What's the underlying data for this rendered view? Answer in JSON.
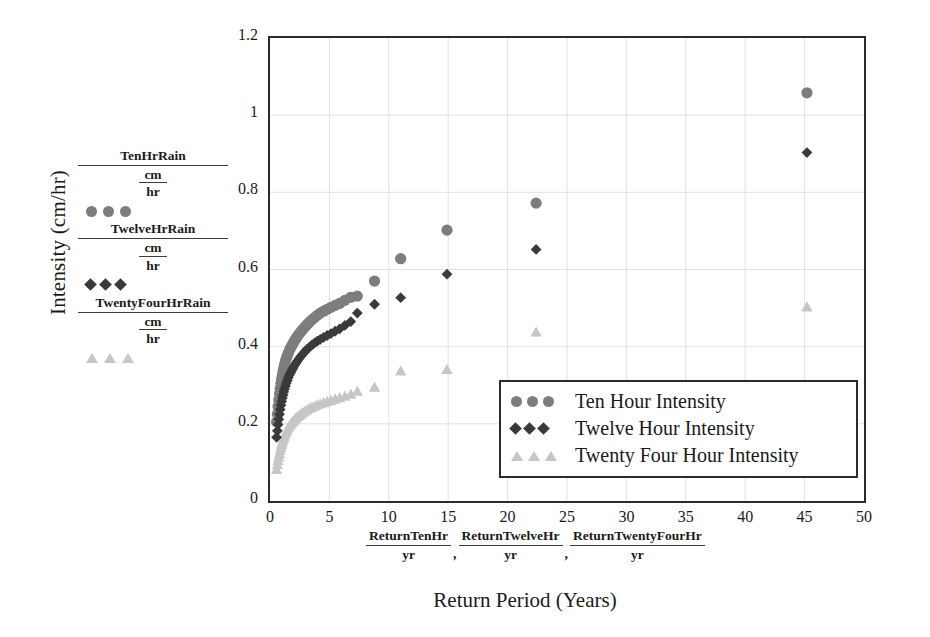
{
  "axes": {
    "y_title": "Intensity (cm/hr)",
    "x_title": "Return Period (Years)",
    "y_ticks": [
      "1.2",
      "1",
      "0.8",
      "0.6",
      "0.4",
      "0.2",
      "0"
    ],
    "x_ticks": [
      "0",
      "5",
      "10",
      "15",
      "20",
      "25",
      "30",
      "35",
      "40",
      "45",
      "50"
    ]
  },
  "left_labels": [
    {
      "numerator": "TenHrRain",
      "den_num": "cm",
      "den_den": "hr",
      "marker": "circle-marker"
    },
    {
      "numerator": "TwelveHrRain",
      "den_num": "cm",
      "den_den": "hr",
      "marker": "diamond-marker"
    },
    {
      "numerator": "TwentyFourHrRain",
      "den_num": "cm",
      "den_den": "hr",
      "marker": "triangle-marker"
    }
  ],
  "bottom_labels": [
    {
      "numerator": "ReturnTenHr",
      "denominator": "yr",
      "separator": ","
    },
    {
      "numerator": "ReturnTwelveHr",
      "denominator": "yr",
      "separator": ","
    },
    {
      "numerator": "ReturnTwentyFourHr",
      "denominator": "yr",
      "separator": ""
    }
  ],
  "legend": {
    "entries": [
      {
        "label": "Ten Hour Intensity",
        "marker": "circle-marker"
      },
      {
        "label": "Twelve Hour Intensity",
        "marker": "diamond-marker"
      },
      {
        "label": "Twenty Four Hour Intensity",
        "marker": "triangle-marker"
      }
    ]
  },
  "colors": {
    "ten_hour": "#7d7d7d",
    "twelve_hour": "#3a3a3a",
    "twenty_four_hour": "#c6c6c6",
    "frame": "#2b2b2b",
    "grid": "#e2e2e2"
  },
  "chart_data": {
    "type": "scatter",
    "title": "",
    "xlabel": "Return Period (Years)",
    "ylabel": "Intensity (cm/hr)",
    "xlim": [
      0,
      50
    ],
    "ylim": [
      0,
      1.2
    ],
    "xticks": [
      0,
      5,
      10,
      15,
      20,
      25,
      30,
      35,
      40,
      45,
      50
    ],
    "yticks": [
      0,
      0.2,
      0.4,
      0.6,
      0.8,
      1.0,
      1.2
    ],
    "grid": "faint vertical and horizontal gridlines",
    "legend_position": "lower right, inside axes",
    "series": [
      {
        "name": "Ten Hour Intensity",
        "marker": "circle",
        "color": "#7d7d7d",
        "points": [
          [
            0.55,
            0.205
          ],
          [
            0.62,
            0.225
          ],
          [
            0.68,
            0.245
          ],
          [
            0.74,
            0.262
          ],
          [
            0.8,
            0.278
          ],
          [
            0.86,
            0.292
          ],
          [
            0.92,
            0.305
          ],
          [
            0.98,
            0.316
          ],
          [
            1.04,
            0.326
          ],
          [
            1.1,
            0.336
          ],
          [
            1.16,
            0.345
          ],
          [
            1.22,
            0.353
          ],
          [
            1.3,
            0.362
          ],
          [
            1.38,
            0.37
          ],
          [
            1.46,
            0.377
          ],
          [
            1.55,
            0.384
          ],
          [
            1.64,
            0.391
          ],
          [
            1.74,
            0.397
          ],
          [
            1.84,
            0.403
          ],
          [
            1.95,
            0.409
          ],
          [
            2.06,
            0.415
          ],
          [
            2.18,
            0.421
          ],
          [
            2.31,
            0.427
          ],
          [
            2.45,
            0.433
          ],
          [
            2.6,
            0.439
          ],
          [
            2.76,
            0.445
          ],
          [
            2.93,
            0.451
          ],
          [
            3.11,
            0.457
          ],
          [
            3.3,
            0.463
          ],
          [
            3.51,
            0.469
          ],
          [
            3.73,
            0.475
          ],
          [
            3.97,
            0.481
          ],
          [
            4.23,
            0.487
          ],
          [
            4.51,
            0.492
          ],
          [
            4.81,
            0.497
          ],
          [
            5.13,
            0.502
          ],
          [
            5.48,
            0.507
          ],
          [
            5.86,
            0.512
          ],
          [
            6.3,
            0.52
          ],
          [
            6.8,
            0.528
          ],
          [
            7.35,
            0.531
          ],
          [
            8.8,
            0.57
          ],
          [
            11.0,
            0.628
          ],
          [
            14.9,
            0.702
          ],
          [
            22.4,
            0.772
          ],
          [
            45.2,
            1.058
          ]
        ]
      },
      {
        "name": "Twelve Hour Intensity",
        "marker": "diamond",
        "color": "#3a3a3a",
        "points": [
          [
            0.55,
            0.165
          ],
          [
            0.62,
            0.182
          ],
          [
            0.68,
            0.198
          ],
          [
            0.74,
            0.212
          ],
          [
            0.8,
            0.225
          ],
          [
            0.86,
            0.237
          ],
          [
            0.92,
            0.248
          ],
          [
            0.98,
            0.258
          ],
          [
            1.04,
            0.267
          ],
          [
            1.1,
            0.275
          ],
          [
            1.16,
            0.283
          ],
          [
            1.22,
            0.29
          ],
          [
            1.3,
            0.298
          ],
          [
            1.38,
            0.306
          ],
          [
            1.46,
            0.313
          ],
          [
            1.55,
            0.32
          ],
          [
            1.64,
            0.327
          ],
          [
            1.74,
            0.333
          ],
          [
            1.84,
            0.339
          ],
          [
            1.95,
            0.345
          ],
          [
            2.06,
            0.351
          ],
          [
            2.18,
            0.357
          ],
          [
            2.31,
            0.363
          ],
          [
            2.45,
            0.369
          ],
          [
            2.6,
            0.375
          ],
          [
            2.76,
            0.381
          ],
          [
            2.93,
            0.387
          ],
          [
            3.11,
            0.393
          ],
          [
            3.3,
            0.398
          ],
          [
            3.51,
            0.404
          ],
          [
            3.73,
            0.409
          ],
          [
            3.97,
            0.414
          ],
          [
            4.23,
            0.419
          ],
          [
            4.51,
            0.424
          ],
          [
            4.81,
            0.429
          ],
          [
            5.13,
            0.434
          ],
          [
            5.48,
            0.44
          ],
          [
            5.86,
            0.446
          ],
          [
            6.3,
            0.455
          ],
          [
            6.8,
            0.465
          ],
          [
            7.35,
            0.487
          ],
          [
            8.8,
            0.51
          ],
          [
            11.0,
            0.527
          ],
          [
            14.9,
            0.588
          ],
          [
            22.4,
            0.652
          ],
          [
            45.2,
            0.903
          ]
        ]
      },
      {
        "name": "Twenty Four Hour Intensity",
        "marker": "triangle",
        "color": "#c6c6c6",
        "points": [
          [
            0.55,
            0.082
          ],
          [
            0.62,
            0.094
          ],
          [
            0.68,
            0.105
          ],
          [
            0.74,
            0.114
          ],
          [
            0.8,
            0.123
          ],
          [
            0.86,
            0.131
          ],
          [
            0.92,
            0.139
          ],
          [
            0.98,
            0.146
          ],
          [
            1.04,
            0.152
          ],
          [
            1.1,
            0.158
          ],
          [
            1.16,
            0.164
          ],
          [
            1.22,
            0.169
          ],
          [
            1.3,
            0.175
          ],
          [
            1.38,
            0.18
          ],
          [
            1.46,
            0.185
          ],
          [
            1.55,
            0.19
          ],
          [
            1.64,
            0.195
          ],
          [
            1.74,
            0.199
          ],
          [
            1.84,
            0.203
          ],
          [
            1.95,
            0.207
          ],
          [
            2.06,
            0.211
          ],
          [
            2.18,
            0.215
          ],
          [
            2.31,
            0.219
          ],
          [
            2.45,
            0.222
          ],
          [
            2.6,
            0.226
          ],
          [
            2.76,
            0.229
          ],
          [
            2.93,
            0.233
          ],
          [
            3.11,
            0.236
          ],
          [
            3.3,
            0.24
          ],
          [
            3.51,
            0.243
          ],
          [
            3.73,
            0.246
          ],
          [
            3.97,
            0.249
          ],
          [
            4.23,
            0.252
          ],
          [
            4.51,
            0.255
          ],
          [
            4.81,
            0.258
          ],
          [
            5.13,
            0.261
          ],
          [
            5.48,
            0.264
          ],
          [
            5.86,
            0.268
          ],
          [
            6.3,
            0.272
          ],
          [
            6.8,
            0.277
          ],
          [
            7.35,
            0.285
          ],
          [
            8.8,
            0.295
          ],
          [
            11.0,
            0.337
          ],
          [
            14.9,
            0.341
          ],
          [
            22.4,
            0.438
          ],
          [
            45.2,
            0.503
          ]
        ]
      }
    ]
  }
}
